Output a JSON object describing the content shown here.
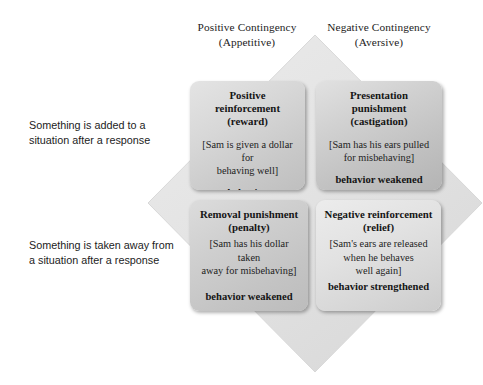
{
  "diagram": {
    "diamond_color": "#e3e3e3",
    "diamond_edge_color": "#d2d2d2"
  },
  "columns": [
    {
      "name": "positive",
      "line1": "Positive Contingency",
      "line2": "(Appetitive)"
    },
    {
      "name": "negative",
      "line1": "Negative Contingency",
      "line2": "(Aversive)"
    }
  ],
  "rows": [
    {
      "name": "added",
      "line1": "Something is added to a",
      "line2": "situation after a response"
    },
    {
      "name": "removed",
      "line1": "Something is taken away from",
      "line2": "a situation after a response"
    }
  ],
  "cells": {
    "positive_reinforcement": {
      "title": "Positive reinforcement",
      "subtitle": "(reward)",
      "example_line1": "[Sam is given a dollar for",
      "example_line2": "behaving well]",
      "outcome": "behavior strengthened"
    },
    "presentation_punishment": {
      "title": "Presentation punishment",
      "subtitle": "(castigation)",
      "example_line1": "[Sam has his ears pulled",
      "example_line2": "for misbehaving]",
      "outcome": "behavior weakened"
    },
    "removal_punishment": {
      "title": "Removal punishment",
      "subtitle": "(penalty)",
      "example_line1": "[Sam has his dollar taken",
      "example_line2": "away for misbehaving]",
      "outcome": "behavior weakened"
    },
    "negative_reinforcement": {
      "title": "Negative reinforcement",
      "subtitle": "(relief)",
      "example_line1": "[Sam's ears are released",
      "example_line2": "when he behaves",
      "example_line3": "well again]",
      "outcome": "behavior strengthened"
    }
  }
}
